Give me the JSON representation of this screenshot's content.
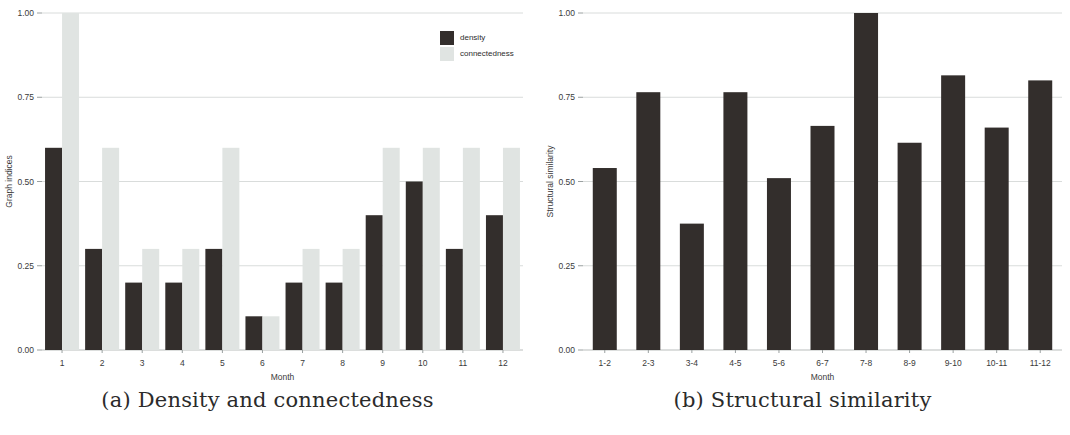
{
  "figure": {
    "panel_a": {
      "caption": "(a) Density and connectedness",
      "chart_data": {
        "type": "bar",
        "title": "",
        "xlabel": "Month",
        "ylabel": "Graph indices",
        "categories": [
          "1",
          "2",
          "3",
          "4",
          "5",
          "6",
          "7",
          "8",
          "9",
          "10",
          "11",
          "12"
        ],
        "series": [
          {
            "name": "density",
            "color": "#332E2C",
            "values": [
              0.6,
              0.3,
              0.2,
              0.2,
              0.3,
              0.1,
              0.2,
              0.2,
              0.4,
              0.5,
              0.3,
              0.4
            ]
          },
          {
            "name": "connectedness",
            "color": "#E0E4E2",
            "values": [
              1.0,
              0.6,
              0.3,
              0.3,
              0.6,
              0.1,
              0.3,
              0.3,
              0.6,
              0.6,
              0.6,
              0.6
            ]
          }
        ],
        "ylim": [
          0.0,
          1.0
        ],
        "yticks": [
          "0.00",
          "0.25",
          "0.50",
          "0.75",
          "1.00"
        ],
        "ytick_values": [
          0.0,
          0.25,
          0.5,
          0.75,
          1.0
        ],
        "grid": true,
        "legend_position": "top-right"
      }
    },
    "panel_b": {
      "caption": "(b) Structural similarity",
      "chart_data": {
        "type": "bar",
        "title": "",
        "xlabel": "Month",
        "ylabel": "Structural similarity",
        "categories": [
          "1-2",
          "2-3",
          "3-4",
          "4-5",
          "5-6",
          "6-7",
          "7-8",
          "8-9",
          "9-10",
          "10-11",
          "11-12"
        ],
        "series": [
          {
            "name": "structural similarity",
            "color": "#332E2C",
            "values": [
              0.54,
              0.765,
              0.375,
              0.765,
              0.51,
              0.665,
              1.0,
              0.615,
              0.815,
              0.66,
              0.8
            ]
          }
        ],
        "ylim": [
          0.0,
          1.0
        ],
        "yticks": [
          "0.00",
          "0.25",
          "0.50",
          "0.75",
          "1.00"
        ],
        "ytick_values": [
          0.0,
          0.25,
          0.5,
          0.75,
          1.0
        ],
        "grid": true,
        "legend_position": "none"
      }
    }
  },
  "colors": {
    "dark_bar": "#332E2C",
    "light_bar": "#E0E4E2",
    "grid": "#d9dcdb",
    "background": "#ffffff"
  }
}
